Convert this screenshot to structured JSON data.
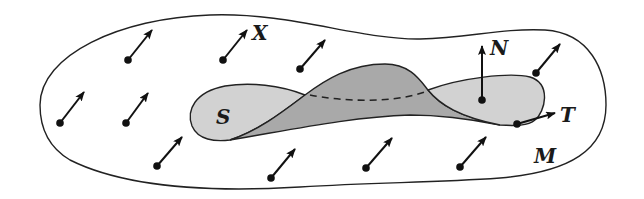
{
  "figure": {
    "labels": {
      "field": "X",
      "surface": "S",
      "normal": "N",
      "tangent": "T",
      "manifold": "M"
    },
    "colors": {
      "surface_light": "#d2d2d2",
      "surface_dark": "#a9a9a9",
      "stroke": "#222222",
      "background": "#ffffff"
    },
    "field_vectors": [
      {
        "from": [
          60,
          123
        ],
        "to": [
          84,
          92
        ]
      },
      {
        "from": [
          126,
          123
        ],
        "to": [
          148,
          93
        ]
      },
      {
        "from": [
          128,
          60
        ],
        "to": [
          152,
          30
        ]
      },
      {
        "from": [
          223,
          60
        ],
        "to": [
          247,
          30
        ]
      },
      {
        "from": [
          300,
          69
        ],
        "to": [
          325,
          40
        ]
      },
      {
        "from": [
          157,
          166
        ],
        "to": [
          182,
          137
        ]
      },
      {
        "from": [
          271,
          178
        ],
        "to": [
          295,
          149
        ]
      },
      {
        "from": [
          366,
          167
        ],
        "to": [
          392,
          138
        ]
      },
      {
        "from": [
          460,
          167
        ],
        "to": [
          486,
          137
        ]
      },
      {
        "from": [
          536,
          73
        ],
        "to": [
          560,
          44
        ]
      }
    ],
    "normal_vector": {
      "from": [
        482,
        100
      ],
      "to": [
        482,
        45
      ]
    },
    "tangent_vector": {
      "from": [
        517,
        124
      ],
      "to": [
        555,
        113
      ]
    }
  }
}
